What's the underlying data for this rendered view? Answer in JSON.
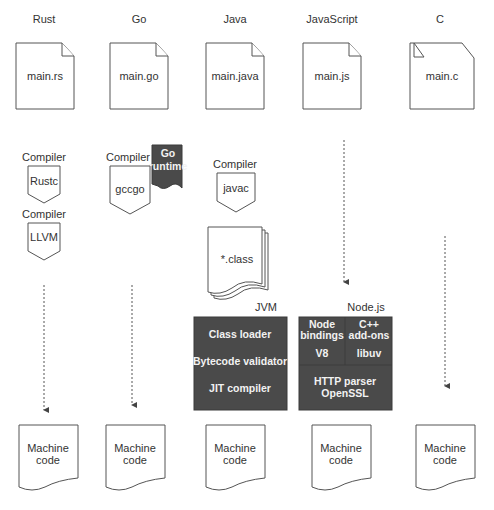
{
  "columns": [
    {
      "id": "rust",
      "language": "Rust",
      "source_file": "main.rs",
      "compilers": [
        {
          "caption": "Compiler",
          "name": "Rustc"
        },
        {
          "caption": "Compiler",
          "name": "LLVM"
        }
      ],
      "output": "Machine\ncode"
    },
    {
      "id": "go",
      "language": "Go",
      "source_file": "main.go",
      "compilers": [
        {
          "caption": "Compiler",
          "name": "gccgo"
        }
      ],
      "runtime": "Go\nruntime",
      "output": "Machine\ncode"
    },
    {
      "id": "java",
      "language": "Java",
      "source_file": "main.java",
      "compilers": [
        {
          "caption": "Compiler",
          "name": "javac"
        }
      ],
      "intermediate": "*.class",
      "vm": {
        "label": "JVM",
        "components": [
          "Class loader",
          "Bytecode validator",
          "JIT compiler"
        ]
      },
      "output": "Machine\ncode"
    },
    {
      "id": "javascript",
      "language": "JavaScript",
      "source_file": "main.js",
      "compilers": [],
      "vm": {
        "label": "Node.js",
        "components": [
          "Node\nbindings",
          "C++\nadd-ons",
          "V8",
          "libuv",
          "HTTP parser\nOpenSSL"
        ]
      },
      "output": "Machine\ncode"
    },
    {
      "id": "c",
      "language": "C",
      "source_file": "main.c",
      "compilers": [
        {
          "caption": "Compiler",
          "name": "GCC"
        }
      ],
      "output": "Machine\ncode"
    }
  ],
  "colors": {
    "dark_box": "#4a4a4a",
    "stroke": "#555555",
    "text": "#333333",
    "light_text": "#f2f2f2"
  }
}
